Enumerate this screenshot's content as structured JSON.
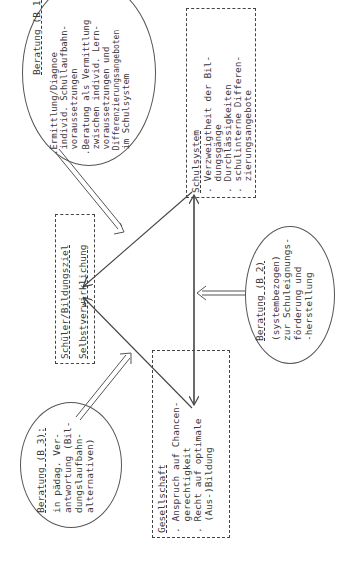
{
  "diagram": {
    "center": {
      "title": "Schüler/Bildungsziel",
      "subtitle": "Selbstverwirklichung"
    },
    "schulsystem": {
      "title": "Schulsystem",
      "items": [
        ". Verzweigtheit der Bil-",
        "  dungsgänge",
        ". Durchlässigkeiten",
        ". schulinterne Differen-",
        "  zierungsangebote"
      ]
    },
    "gesellschaft": {
      "title": "Gesellschaft",
      "items": [
        ". Anspruch auf Chancen-",
        "  gerechtigkeit",
        ". Recht auf optimale",
        "  (Aus-)Bildung"
      ]
    },
    "beratung_b1": {
      "title": "Beratung (B 1)",
      "lines": [
        ".Ermittlung/Diagnoe",
        " individ. Schullaufbahn-",
        " voraussetzungen",
        ".Beratung als Vermittlung",
        " zwischen individ. Lern-",
        " voraussetzungen und",
        " Differenzierungsangeboten",
        " im Schulsystem"
      ]
    },
    "beratung_b2": {
      "title": "Beratung (B 2)",
      "lines": [
        "(systembezogen)",
        "zur Schuleignungs-",
        "förderung und",
        "-herstellung"
      ]
    },
    "beratung_b3": {
      "title": "Beratung (B 3):",
      "lines": [
        "in pädag. Ver-",
        "antwortung (Bil-",
        "dungslaufbahn-",
        "alternativen)"
      ]
    },
    "colors": {
      "line": "#444444",
      "text": "#3a3a3a",
      "background": "#ffffff"
    }
  }
}
